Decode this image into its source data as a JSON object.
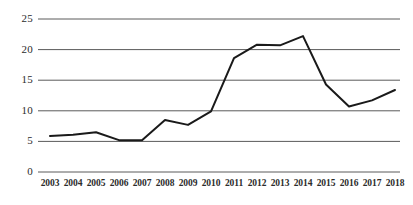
{
  "chart_data": {
    "type": "line",
    "title": "",
    "subtitle": "",
    "xlabel": "",
    "ylabel": "",
    "x": [
      2003,
      2004,
      2005,
      2006,
      2007,
      2008,
      2009,
      2010,
      2011,
      2012,
      2013,
      2014,
      2015,
      2016,
      2017,
      2018
    ],
    "categories": [
      "2003",
      "2004",
      "2005",
      "2006",
      "2007",
      "2008",
      "2009",
      "2010",
      "2011",
      "2012",
      "2013",
      "2014",
      "2015",
      "2016",
      "2017",
      "2018"
    ],
    "values": [
      5.9,
      6.1,
      6.5,
      5.2,
      5.2,
      8.5,
      7.7,
      9.9,
      18.6,
      20.8,
      20.7,
      22.2,
      14.3,
      10.7,
      11.7,
      13.4
    ],
    "series": [
      {
        "name": "",
        "values": [
          5.9,
          6.1,
          6.5,
          5.2,
          5.2,
          8.5,
          7.7,
          9.9,
          18.6,
          20.8,
          20.7,
          22.2,
          14.3,
          10.7,
          11.7,
          13.4
        ],
        "color": "#1a1a1a"
      }
    ],
    "ylim": [
      0,
      25
    ],
    "yticks": [
      0,
      5,
      10,
      15,
      20,
      25
    ],
    "ytick_labels": [
      "0",
      "5",
      "10",
      "15",
      "20",
      "25"
    ],
    "xtick_labels": [
      "2003",
      "2004",
      "2005",
      "2006",
      "2007",
      "2008",
      "2009",
      "2010",
      "2011",
      "2012",
      "2013",
      "2014",
      "2015",
      "2016",
      "2017",
      "2018"
    ],
    "grid": {
      "horizontal": true,
      "vertical": false,
      "color": "#5a5a5a"
    },
    "legend": {
      "visible": false,
      "position": "none",
      "entries": []
    },
    "annotations": [],
    "line_color": "#1a1a1a",
    "line_width": 2,
    "markers": false,
    "background_color": "#ffffff"
  },
  "axes": {
    "y_labels": [
      {
        "value": "25",
        "y": 19
      },
      {
        "value": "20",
        "y": 49.6
      },
      {
        "value": "15",
        "y": 80.2
      },
      {
        "value": "10",
        "y": 110.8
      },
      {
        "value": "5",
        "y": 141.4
      },
      {
        "value": "0",
        "y": 172
      }
    ],
    "x_labels": [
      {
        "value": "2003",
        "x": 50
      },
      {
        "value": "2004",
        "x": 73
      },
      {
        "value": "2005",
        "x": 96
      },
      {
        "value": "2006",
        "x": 119
      },
      {
        "value": "2007",
        "x": 142
      },
      {
        "value": "2008",
        "x": 165
      },
      {
        "value": "2009",
        "x": 188
      },
      {
        "value": "2010",
        "x": 211
      },
      {
        "value": "2011",
        "x": 234
      },
      {
        "value": "2012",
        "x": 257
      },
      {
        "value": "2013",
        "x": 280
      },
      {
        "value": "2014",
        "x": 303
      },
      {
        "value": "2015",
        "x": 326
      },
      {
        "value": "2016",
        "x": 349
      },
      {
        "value": "2017",
        "x": 372
      },
      {
        "value": "2018",
        "x": 395
      }
    ]
  }
}
